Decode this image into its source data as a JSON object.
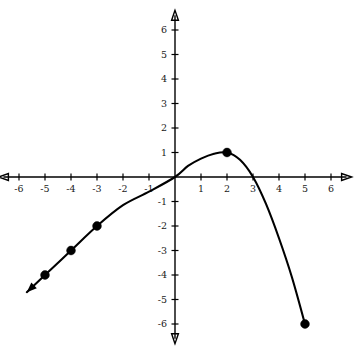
{
  "figure": {
    "kind": "coordinate-plane-graph",
    "background_color": "#ffffff",
    "ink_color": "#000000"
  },
  "chart_data": {
    "type": "line",
    "title": "",
    "subtitle": "",
    "xlabel": "",
    "ylabel": "",
    "xlim": [
      -6.6,
      6.6
    ],
    "ylim": [
      -6.6,
      6.6
    ],
    "grid": false,
    "legend": null,
    "x_ticks": [
      -6,
      -5,
      -4,
      -3,
      -2,
      -1,
      1,
      2,
      3,
      4,
      5,
      6
    ],
    "y_ticks": [
      -6,
      -5,
      -4,
      -3,
      -2,
      -1,
      1,
      2,
      3,
      4,
      5,
      6
    ],
    "x_tick_labels": [
      "-6",
      "-5",
      "-4",
      "-3",
      "-2",
      "-1",
      "1",
      "2",
      "3",
      "4",
      "5",
      "6"
    ],
    "y_tick_labels": [
      "-6",
      "-5",
      "-4",
      "-3",
      "-2",
      "-1",
      "1",
      "2",
      "3",
      "4",
      "5",
      "6"
    ],
    "axes": {
      "x_axis_arrows": "both",
      "y_axis_arrows": "both",
      "origin_label": ""
    },
    "series": [
      {
        "name": "curve",
        "style": "solid",
        "color": "#000000",
        "left_end": "arrow",
        "right_end": "closed-dot",
        "x": [
          -5.7,
          -5,
          -4,
          -3,
          -2,
          -1,
          0,
          0.5,
          1,
          1.5,
          2,
          2.5,
          3,
          3.5,
          4,
          4.5,
          5
        ],
        "y": [
          -4.7,
          -4,
          -3,
          -2,
          -1.15,
          -0.6,
          0,
          0.45,
          0.75,
          0.95,
          1,
          0.7,
          0,
          -1.1,
          -2.5,
          -4.1,
          -6
        ]
      }
    ],
    "marked_points": [
      {
        "label": "(-5, -4)",
        "x": -5,
        "y": -4,
        "style": "closed"
      },
      {
        "label": "(-4, -3)",
        "x": -4,
        "y": -3,
        "style": "closed"
      },
      {
        "label": "(-3, -2)",
        "x": -3,
        "y": -2,
        "style": "closed"
      },
      {
        "label": "(2, 1)",
        "x": 2,
        "y": 1,
        "style": "closed"
      },
      {
        "label": "(5, -6)",
        "x": 5,
        "y": -6,
        "style": "closed"
      }
    ],
    "annotations": [
      {
        "text": "x-intercept at x = 3",
        "x": 3,
        "y": 0
      },
      {
        "text": "vertex / maximum at (2, 1)",
        "x": 2,
        "y": 1
      },
      {
        "text": "passes through origin",
        "x": 0,
        "y": 0
      }
    ]
  }
}
